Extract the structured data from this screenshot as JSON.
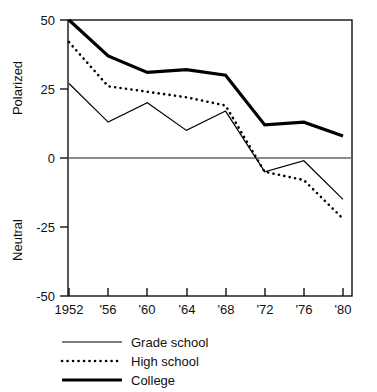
{
  "chart_data": {
    "type": "line",
    "title": "",
    "subtitle": "",
    "xlabel": "",
    "ylabel": "",
    "y_axis_upper_label": "Polarized",
    "y_axis_lower_label": "Neutral",
    "x": [
      1952,
      1956,
      1960,
      1964,
      1968,
      1972,
      1976,
      1980
    ],
    "categories": [
      "1952",
      "'56",
      "'60",
      "'64",
      "'68",
      "'72",
      "'76",
      "'80"
    ],
    "xticklabels": [
      "1952",
      "'56",
      "'60",
      "'64",
      "'68",
      "'72",
      "'76",
      "'80"
    ],
    "yticklabels": [
      "50",
      "25",
      "0",
      "-25",
      "-50"
    ],
    "yticks": [
      50,
      25,
      0,
      -25,
      -50
    ],
    "ylim": [
      -50,
      50
    ],
    "xlim": [
      1950,
      1982
    ],
    "grid": false,
    "zero_line": true,
    "legend_position": "below-left",
    "series": [
      {
        "name": "Grade school",
        "style": "solid-thin",
        "color": "#000000",
        "linewidth": 1.2,
        "values": [
          27,
          13,
          20,
          10,
          17,
          -5,
          -1,
          -15
        ]
      },
      {
        "name": "High school",
        "style": "dotted",
        "color": "#000000",
        "linewidth": 2.6,
        "values": [
          42,
          26,
          24,
          22,
          19,
          -5,
          -8,
          -22
        ]
      },
      {
        "name": "College",
        "style": "solid-thick",
        "color": "#000000",
        "linewidth": 3.2,
        "values": [
          50,
          37,
          31,
          32,
          30,
          12,
          13,
          8
        ]
      }
    ],
    "legend": [
      {
        "label": "Grade school",
        "style": "solid-thin"
      },
      {
        "label": "High school",
        "style": "dotted"
      },
      {
        "label": "College",
        "style": "solid-thick"
      }
    ]
  },
  "colors": {
    "ink": "#111111",
    "axis": "#111111",
    "zero_line": "#555555",
    "background": "#ffffff"
  }
}
